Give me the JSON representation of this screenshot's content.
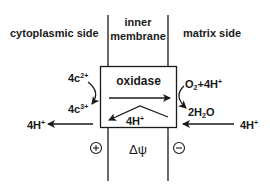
{
  "headers": {
    "left": "cytoplasmic side",
    "middle_line1": "inner",
    "middle_line2": "membrane",
    "right": "matrix side"
  },
  "box": {
    "label": "oxidase",
    "inner_proton_count": "4H",
    "inner_proton_charge": "+"
  },
  "left_reaction": {
    "reactant_count": "4c",
    "reactant_charge": "2+",
    "product_count": "4c",
    "product_charge": "3+"
  },
  "right_reaction": {
    "reactant_o2": "O",
    "reactant_o2_sub": "2",
    "reactant_plus": "+4H",
    "reactant_charge": "+",
    "product_prefix": "2H",
    "product_sub": "2",
    "product_suffix": "O"
  },
  "proton_out_left": {
    "count": "4H",
    "charge": "+"
  },
  "proton_in_right": {
    "count": "4H",
    "charge": "+"
  },
  "potential": {
    "positive_symbol": "+",
    "negative_symbol": "−",
    "label": "Δψ"
  },
  "colors": {
    "ink": "#1a1a1a",
    "background": "#ffffff"
  }
}
